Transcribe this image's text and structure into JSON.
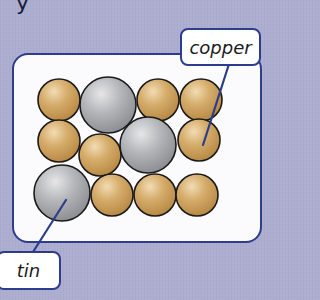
{
  "header": {
    "partial_text": "y"
  },
  "diagram": {
    "labels": {
      "copper": "copper",
      "tin": "tin"
    },
    "colors": {
      "background": "#acadd0",
      "panel": "#fbfbfd",
      "outline": "#2d3d8c",
      "copper": "#c99d5a",
      "copper_highlight": "#ecd3a6",
      "tin": "#a7a8ab",
      "tin_highlight": "#e0e0e2",
      "atom_outline": "#1a1a1a"
    },
    "atoms": [
      {
        "element": "copper",
        "row": 1,
        "cx": 59,
        "cy": 100,
        "r": 21
      },
      {
        "element": "tin",
        "row": 1,
        "cx": 108,
        "cy": 105,
        "r": 28
      },
      {
        "element": "copper",
        "row": 1,
        "cx": 158,
        "cy": 100,
        "r": 21
      },
      {
        "element": "copper",
        "row": 1,
        "cx": 201,
        "cy": 100,
        "r": 21
      },
      {
        "element": "copper",
        "row": 2,
        "cx": 59,
        "cy": 141,
        "r": 21
      },
      {
        "element": "copper",
        "row": 2,
        "cx": 100,
        "cy": 155,
        "r": 21
      },
      {
        "element": "tin",
        "row": 2,
        "cx": 148,
        "cy": 145,
        "r": 28
      },
      {
        "element": "copper",
        "row": 2,
        "cx": 199,
        "cy": 140,
        "r": 21
      },
      {
        "element": "tin",
        "row": 3,
        "cx": 62,
        "cy": 193,
        "r": 28
      },
      {
        "element": "copper",
        "row": 3,
        "cx": 112,
        "cy": 195,
        "r": 21
      },
      {
        "element": "copper",
        "row": 3,
        "cx": 155,
        "cy": 195,
        "r": 21
      },
      {
        "element": "copper",
        "row": 3,
        "cx": 197,
        "cy": 195,
        "r": 21
      }
    ],
    "pointers": [
      {
        "label": "copper",
        "from": [
          229,
          64
        ],
        "to": [
          203,
          145
        ]
      },
      {
        "label": "tin",
        "from": [
          33,
          252
        ],
        "to": [
          66,
          200
        ]
      }
    ]
  }
}
